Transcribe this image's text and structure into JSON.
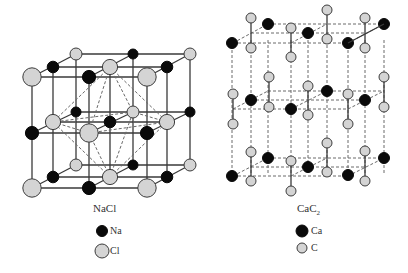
{
  "colors": {
    "background": "#ffffff",
    "bond": "#3a3a3a",
    "dash": "#6a6a6a",
    "dark_atom": "#0a0a0a",
    "light_atom_fill": "#d4d4d4",
    "light_atom_stroke": "#3c3c3c"
  },
  "nacl": {
    "title": "NaCl",
    "legend": [
      {
        "label": "Na",
        "kind": "dark"
      },
      {
        "label": "Cl",
        "kind": "light"
      }
    ],
    "layers": [
      {
        "name": "top",
        "rows": [
          {
            "y": 54,
            "atoms": [
              {
                "x": 76,
                "kind": "light"
              },
              {
                "x": 133,
                "kind": "dark"
              },
              {
                "x": 190,
                "kind": "light"
              }
            ]
          },
          {
            "y": 67,
            "atoms": [
              {
                "x": 53,
                "kind": "dark"
              },
              {
                "x": 110,
                "kind": "light"
              },
              {
                "x": 167,
                "kind": "dark"
              }
            ]
          },
          {
            "y": 77,
            "atoms": [
              {
                "x": 32,
                "kind": "light"
              },
              {
                "x": 89,
                "kind": "dark"
              },
              {
                "x": 147,
                "kind": "light"
              }
            ]
          }
        ]
      },
      {
        "name": "middle",
        "rows": [
          {
            "y": 112,
            "atoms": [
              {
                "x": 76,
                "kind": "dark"
              },
              {
                "x": 133,
                "kind": "light"
              },
              {
                "x": 190,
                "kind": "dark"
              }
            ]
          },
          {
            "y": 122,
            "atoms": [
              {
                "x": 53,
                "kind": "light"
              },
              {
                "x": 110,
                "kind": "dark"
              },
              {
                "x": 167,
                "kind": "light"
              }
            ]
          },
          {
            "y": 133,
            "atoms": [
              {
                "x": 32,
                "kind": "dark"
              },
              {
                "x": 89,
                "kind": "light"
              },
              {
                "x": 147,
                "kind": "dark"
              }
            ]
          }
        ]
      },
      {
        "name": "bottom",
        "rows": [
          {
            "y": 165,
            "atoms": [
              {
                "x": 76,
                "kind": "light"
              },
              {
                "x": 133,
                "kind": "dark"
              },
              {
                "x": 190,
                "kind": "light"
              }
            ]
          },
          {
            "y": 177,
            "atoms": [
              {
                "x": 53,
                "kind": "dark"
              },
              {
                "x": 110,
                "kind": "light"
              },
              {
                "x": 167,
                "kind": "dark"
              }
            ]
          },
          {
            "y": 188,
            "atoms": [
              {
                "x": 32,
                "kind": "light"
              },
              {
                "x": 89,
                "kind": "dark"
              },
              {
                "x": 147,
                "kind": "light"
              }
            ]
          }
        ]
      }
    ],
    "octahedron": {
      "top": [
        110,
        67
      ],
      "bottom": [
        110,
        177
      ],
      "equator": [
        [
          53,
          122
        ],
        [
          89,
          133
        ],
        [
          167,
          122
        ],
        [
          133,
          112
        ]
      ]
    }
  },
  "cac2": {
    "title": "CaC",
    "title_sub": "2",
    "legend": [
      {
        "label": "Ca",
        "kind": "dark"
      },
      {
        "label": "C",
        "kind": "light"
      }
    ],
    "layers": [
      {
        "name": "top",
        "frame": {
          "back_y": 24,
          "mid_y": 33,
          "front_y": 43
        },
        "ca": [
          [
            232,
            43
          ],
          [
            268,
            24
          ],
          [
            308,
            33
          ],
          [
            348,
            43
          ],
          [
            384,
            24
          ]
        ],
        "c2": [
          [
            251,
            18,
            48
          ],
          [
            291,
            28,
            57
          ],
          [
            327,
            10,
            39
          ],
          [
            365,
            18,
            48
          ]
        ]
      },
      {
        "name": "middle",
        "frame": {
          "back_y": 91,
          "mid_y": 100,
          "front_y": 109
        },
        "ca": [
          [
            251,
            100
          ],
          [
            291,
            109
          ],
          [
            327,
            91
          ],
          [
            365,
            100
          ]
        ],
        "c2": [
          [
            233,
            94,
            124
          ],
          [
            269,
            77,
            107
          ],
          [
            308,
            86,
            115
          ],
          [
            348,
            94,
            124
          ],
          [
            384,
            77,
            107
          ]
        ]
      },
      {
        "name": "bottom",
        "frame": {
          "back_y": 158,
          "mid_y": 167,
          "front_y": 176
        },
        "ca": [
          [
            232,
            176
          ],
          [
            268,
            158
          ],
          [
            308,
            167
          ],
          [
            348,
            175
          ],
          [
            384,
            158
          ]
        ],
        "c2": [
          [
            251,
            152,
            181
          ],
          [
            291,
            161,
            191
          ],
          [
            327,
            143,
            172
          ],
          [
            365,
            151,
            181
          ]
        ]
      }
    ]
  }
}
